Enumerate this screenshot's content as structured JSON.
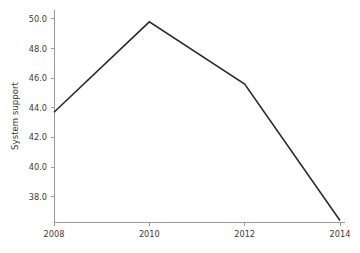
{
  "chart_data": {
    "type": "line",
    "title": "",
    "xlabel": "",
    "ylabel": "System support",
    "x": [
      2008,
      2010,
      2012,
      2014
    ],
    "categories": [
      "2008",
      "2010",
      "2012",
      "2014"
    ],
    "values": [
      43.7,
      49.8,
      45.6,
      36.4
    ],
    "series": [
      {
        "name": "System support",
        "values": [
          43.7,
          49.8,
          45.6,
          36.4
        ]
      }
    ],
    "xlim": [
      2008,
      2014
    ],
    "ylim": [
      36.3,
      50.6
    ],
    "xticks": [
      2008,
      2010,
      2012,
      2014
    ],
    "yticks": [
      38.0,
      40.0,
      42.0,
      44.0,
      46.0,
      48.0,
      50.0
    ],
    "xtick_labels": [
      "2008",
      "2010",
      "2012",
      "2014"
    ],
    "ytick_labels": [
      "38.0",
      "40.0",
      "42.0",
      "44.0",
      "46.0",
      "48.0",
      "50.0"
    ],
    "grid": false,
    "legend": false,
    "legend_position": "none",
    "line_color": "#2b2b2b",
    "axis_color": "#9a9a9a",
    "background_color": "#ffffff",
    "annotations": []
  }
}
